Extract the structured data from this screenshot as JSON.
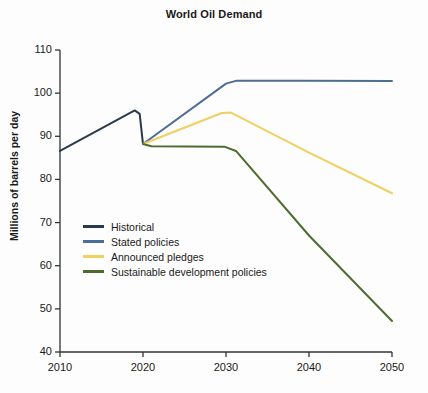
{
  "chart_data": {
    "type": "line",
    "title": "World Oil Demand",
    "xlabel": "",
    "ylabel": "Millions of barrels per day",
    "xlim": [
      2010,
      2050
    ],
    "ylim": [
      40,
      110
    ],
    "xticks": [
      2010,
      2020,
      2030,
      2040,
      2050
    ],
    "yticks": [
      40,
      50,
      60,
      70,
      80,
      90,
      100,
      110
    ],
    "grid": false,
    "legend_position": "lower-left-inside",
    "series": [
      {
        "name": "Historical",
        "color": "#2b3a4a",
        "points": [
          [
            2010,
            86.6
          ],
          [
            2019,
            96.0
          ],
          [
            2019.6,
            95.2
          ],
          [
            2020,
            88.2
          ]
        ]
      },
      {
        "name": "Stated policies",
        "color": "#4d6e93",
        "points": [
          [
            2020,
            88.2
          ],
          [
            2030,
            102.2
          ],
          [
            2031.3,
            102.9
          ],
          [
            2040,
            102.9
          ],
          [
            2050,
            102.8
          ]
        ]
      },
      {
        "name": "Announced pledges",
        "color": "#f0d060",
        "points": [
          [
            2020,
            88.2
          ],
          [
            2029.5,
            95.4
          ],
          [
            2030.6,
            95.5
          ],
          [
            2040,
            86.2
          ],
          [
            2050,
            76.8
          ]
        ]
      },
      {
        "name": "Sustainable development policies",
        "color": "#4e6b30",
        "points": [
          [
            2020,
            88.2
          ],
          [
            2021,
            87.7
          ],
          [
            2029.8,
            87.6
          ],
          [
            2031.2,
            86.6
          ],
          [
            2040,
            67.0
          ],
          [
            2050,
            47.2
          ]
        ]
      }
    ]
  },
  "legend": {
    "items": [
      {
        "label": "Historical",
        "color": "#2b3a4a"
      },
      {
        "label": "Stated policies",
        "color": "#4d6e93"
      },
      {
        "label": "Announced pledges",
        "color": "#f0d060"
      },
      {
        "label": "Sustainable development policies",
        "color": "#4e6b30"
      }
    ]
  },
  "axes": {
    "y_tick_labels": [
      "110",
      "100",
      "90",
      "80",
      "70",
      "60",
      "50",
      "40"
    ],
    "x_tick_labels": [
      "2010",
      "2020",
      "2030",
      "2040",
      "2050"
    ]
  }
}
